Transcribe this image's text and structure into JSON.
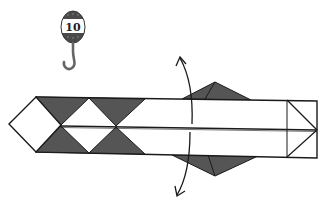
{
  "diagram": {
    "type": "origami-folding-step",
    "step_badge": {
      "number": "10",
      "icon": "hook-icon"
    },
    "colors": {
      "paper_colored_side": "#555555",
      "paper_white_side": "#ffffff",
      "line": "#1a1a1a",
      "badge_band": "#ffffff",
      "hook": "#666666"
    },
    "elements": [
      {
        "name": "folded-strip",
        "description": "long horizontal strip with center crease"
      },
      {
        "name": "left-point-diamond",
        "description": "white diamond at left end"
      },
      {
        "name": "dark-triangles-top",
        "count": 2
      },
      {
        "name": "dark-triangles-bottom",
        "count": 2
      },
      {
        "name": "upper-flap",
        "description": "dark triangular flap above strip"
      },
      {
        "name": "lower-flap",
        "description": "dark triangular flap below strip"
      },
      {
        "name": "fold-arrow-up",
        "description": "curved arrow pointing up-left"
      },
      {
        "name": "fold-arrow-down",
        "description": "curved arrow pointing down-left"
      },
      {
        "name": "right-end-square",
        "description": "square with arrowhead creases at right end"
      }
    ]
  }
}
